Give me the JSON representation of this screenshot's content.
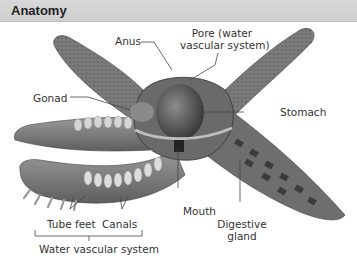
{
  "header": {
    "title": "Anatomy"
  },
  "diagram": {
    "labels": {
      "anus": "Anus",
      "pore_line1": "Pore (water",
      "pore_line2": "vascular system)",
      "gonad": "Gonad",
      "stomach": "Stomach",
      "mouth": "Mouth",
      "digestive_line1": "Digestive",
      "digestive_line2": "gland",
      "tube_feet": "Tube feet",
      "canals": "Canals",
      "water_vascular_system": "Water vascular system"
    }
  }
}
